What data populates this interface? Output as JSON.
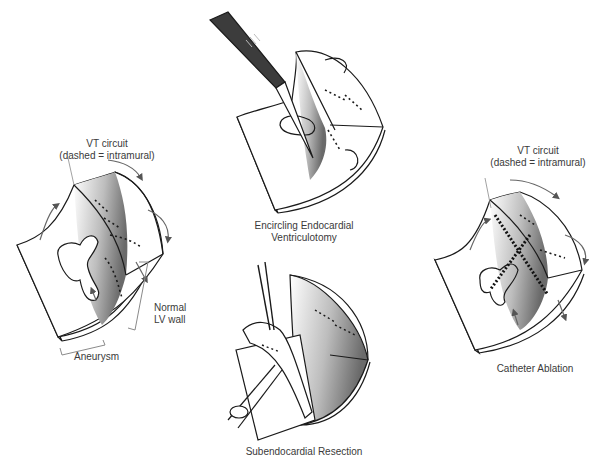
{
  "panels": {
    "aneurysm": {
      "callout_line1": "VT circuit",
      "callout_line2": "(dashed = intramural)",
      "normal_line1": "Normal",
      "normal_line2": "LV wall",
      "aneurysm_label": "Aneurysm"
    },
    "ventriculotomy": {
      "caption_line1": "Encircling Endocardial",
      "caption_line2": "Ventriculotomy"
    },
    "resection": {
      "caption": "Subendocardial Resection"
    },
    "ablation": {
      "callout_line1": "VT circuit",
      "callout_line2": "(dashed = intramural)",
      "caption": "Catheter Ablation"
    }
  },
  "colors": {
    "line": "#1a1a1a",
    "label_line": "#8a8a8a",
    "handle": "#3c3c3c",
    "ablation_dots": "#111111"
  }
}
